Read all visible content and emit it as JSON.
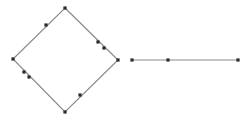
{
  "canvas": {
    "width": 251,
    "height": 122,
    "background_color": "#ffffff"
  },
  "style": {
    "line_color": "#8a8a8a",
    "line_width": 1.2,
    "point_color": "#2b2b2b",
    "point_size": 3.2,
    "point_shape": "square"
  },
  "figure": {
    "title": ""
  },
  "shapes": [
    {
      "id": "diamond",
      "name": "diamond-polygon",
      "type": "polygon",
      "closed": true,
      "points": [
        [
          65,
          8
        ],
        [
          118,
          60
        ],
        [
          65,
          112
        ],
        [
          13,
          59
        ]
      ]
    },
    {
      "id": "segment",
      "name": "horizontal-segment",
      "type": "polyline",
      "closed": false,
      "points": [
        [
          132,
          60
        ],
        [
          238,
          60
        ]
      ]
    }
  ],
  "markers": [
    {
      "id": "d-top",
      "name": "diamond-vertex-top",
      "shape": "diamond",
      "x": 65,
      "y": 8
    },
    {
      "id": "d-ul-1",
      "name": "diamond-edge-point-upper-left",
      "shape": "diamond",
      "x": 46,
      "y": 25
    },
    {
      "id": "d-left",
      "name": "diamond-vertex-left",
      "shape": "diamond",
      "x": 13,
      "y": 59
    },
    {
      "id": "d-ll-1",
      "name": "diamond-edge-point-lower-left-a",
      "shape": "diamond",
      "x": 24,
      "y": 72
    },
    {
      "id": "d-ll-2",
      "name": "diamond-edge-point-lower-left-b",
      "shape": "diamond",
      "x": 29,
      "y": 77
    },
    {
      "id": "d-bottom",
      "name": "diamond-vertex-bottom",
      "shape": "diamond",
      "x": 65,
      "y": 112
    },
    {
      "id": "d-lr-1",
      "name": "diamond-edge-point-lower-right",
      "shape": "diamond",
      "x": 80,
      "y": 95
    },
    {
      "id": "d-right",
      "name": "diamond-vertex-right",
      "shape": "diamond",
      "x": 118,
      "y": 60
    },
    {
      "id": "d-ur-2",
      "name": "diamond-edge-point-upper-right-b",
      "shape": "diamond",
      "x": 104,
      "y": 48
    },
    {
      "id": "d-ur-1",
      "name": "diamond-edge-point-upper-right-a",
      "shape": "diamond",
      "x": 98,
      "y": 42
    },
    {
      "id": "s-left",
      "name": "segment-endpoint-left",
      "shape": "segment",
      "x": 132,
      "y": 60
    },
    {
      "id": "s-mid",
      "name": "segment-midpoint",
      "shape": "segment",
      "x": 168,
      "y": 60
    },
    {
      "id": "s-right",
      "name": "segment-endpoint-right",
      "shape": "segment",
      "x": 238,
      "y": 60
    }
  ]
}
